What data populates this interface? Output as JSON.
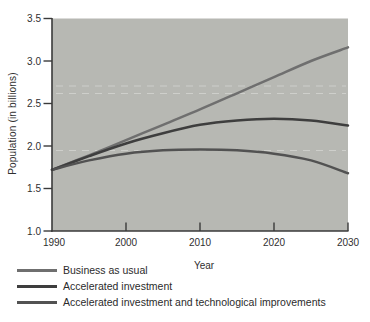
{
  "figure": {
    "background": "#ffffff",
    "plot_background": "#b7b8b3",
    "axis_color": "#3a3a3a",
    "text_color": "#2f2f2f"
  },
  "chart_data": {
    "type": "line",
    "title": "",
    "xlabel": "Year",
    "ylabel": "Population (in billions)",
    "xlim": [
      1990,
      2030
    ],
    "ylim": [
      1.0,
      3.5
    ],
    "grid": false,
    "legend_position": "below-left",
    "x_ticks": [
      1990,
      2000,
      2010,
      2020,
      2030
    ],
    "x_tick_labels": [
      "1990",
      "2000",
      "2010",
      "2020",
      "2030"
    ],
    "y_ticks": [
      1.0,
      1.5,
      2.0,
      2.5,
      3.0,
      3.5
    ],
    "y_tick_labels": [
      "1.0",
      "1.5",
      "2.0",
      "2.5",
      "3.0",
      "3.5"
    ],
    "x": [
      1990,
      1995,
      2000,
      2005,
      2010,
      2015,
      2020,
      2025,
      2030
    ],
    "series": [
      {
        "name": "Business as usual",
        "color": "#6f6f6f",
        "values": [
          1.72,
          1.89,
          2.07,
          2.25,
          2.43,
          2.62,
          2.81,
          3.0,
          3.16
        ]
      },
      {
        "name": "Accelerated investment",
        "color": "#3e3e3e",
        "values": [
          1.72,
          1.88,
          2.03,
          2.15,
          2.25,
          2.3,
          2.32,
          2.3,
          2.24
        ]
      },
      {
        "name": "Accelerated investment and technological improvements",
        "color": "#525252",
        "values": [
          1.72,
          1.83,
          1.91,
          1.95,
          1.96,
          1.95,
          1.91,
          1.83,
          1.68
        ]
      }
    ]
  }
}
